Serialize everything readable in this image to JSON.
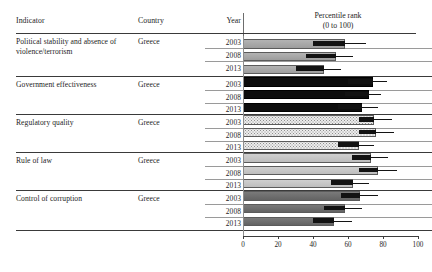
{
  "table": {
    "headers": {
      "indicator": "Indicator",
      "country": "Country",
      "year": "Year",
      "plot_title_line1": "Percentile rank",
      "plot_title_line2": "(0 to 100)"
    },
    "country_value": "Greece",
    "years": [
      "2003",
      "2008",
      "2013"
    ]
  },
  "chart_data": {
    "type": "bar",
    "title": "Percentile rank (0 to 100)",
    "subtitle": "(0 to 100)",
    "xlabel": "Percentile rank",
    "ylabel": "",
    "xlim": [
      0,
      100
    ],
    "xticks": [
      0,
      20,
      40,
      60,
      80,
      100
    ],
    "xtick_labels": [
      "0",
      "20",
      "40",
      "60",
      "80",
      "100"
    ],
    "grid": false,
    "legend": "none",
    "orientation": "horizontal",
    "country": "Greece",
    "categories": [
      "2003",
      "2008",
      "2013"
    ],
    "series": [
      {
        "name": "Political stability and absence of violence/terrorism",
        "fill": "gray-mid",
        "color": "#a8a8a8",
        "values": [
          58,
          53,
          46
        ],
        "cap_start": [
          40,
          36,
          30
        ],
        "whisker_end": [
          70,
          63,
          56
        ]
      },
      {
        "name": "Government effectiveness",
        "fill": "black",
        "color": "#0d0d0d",
        "values": [
          74,
          72,
          68
        ],
        "cap_start": [
          60,
          58,
          54
        ],
        "whisker_end": [
          82,
          79,
          77
        ]
      },
      {
        "name": "Regulatory quality",
        "fill": "stipple",
        "color": "#ececec",
        "values": [
          75,
          76,
          66
        ],
        "cap_start": [
          66,
          66,
          54
        ],
        "whisker_end": [
          85,
          86,
          75
        ]
      },
      {
        "name": "Rule of law",
        "fill": "gray-light",
        "color": "#c6c6c6",
        "values": [
          73,
          77,
          63
        ],
        "cap_start": [
          62,
          66,
          50
        ],
        "whisker_end": [
          83,
          88,
          72
        ]
      },
      {
        "name": "Control of corruption",
        "fill": "gray-dark",
        "color": "#6f6f6f",
        "values": [
          67,
          58,
          52
        ],
        "cap_start": [
          56,
          46,
          40
        ],
        "whisker_end": [
          77,
          68,
          62
        ]
      }
    ]
  },
  "rows": [
    {
      "indicator": "Political stability and absence of violence/terrorism",
      "country": "Greece"
    },
    {
      "indicator": "Government effectiveness",
      "country": "Greece"
    },
    {
      "indicator": "Regulatory quality",
      "country": "Greece"
    },
    {
      "indicator": "Rule of law",
      "country": "Greece"
    },
    {
      "indicator": "Control of corruption",
      "country": "Greece"
    }
  ]
}
